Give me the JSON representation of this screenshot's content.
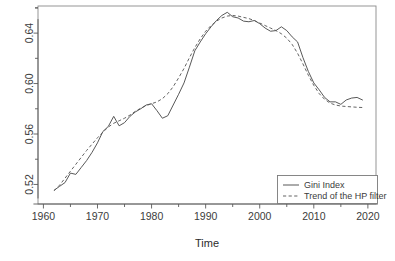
{
  "chart_data": {
    "type": "line",
    "title": "",
    "xlabel": "Time",
    "ylabel": "",
    "xlim": [
      1959.0,
      2021.5
    ],
    "ylim": [
      0.5045,
      0.6615
    ],
    "grid": false,
    "legend_position": "bottom-right",
    "x_ticks": [
      1960,
      1970,
      1980,
      1990,
      2000,
      2010,
      2020
    ],
    "x_tick_labels": [
      "1960",
      "1970",
      "1980",
      "1990",
      "2000",
      "2010",
      "2020"
    ],
    "x_minor_ticks": [
      1965,
      1975,
      1985,
      1995,
      2005,
      2015
    ],
    "y_ticks": [
      0.52,
      0.56,
      0.6,
      0.64
    ],
    "y_tick_labels": [
      "0.52",
      "0.56",
      "0.60",
      "0.64"
    ],
    "y_minor_ticks": [
      0.54,
      0.58,
      0.62,
      0.66
    ],
    "x": [
      1962,
      1963,
      1964,
      1965,
      1966,
      1967,
      1968,
      1969,
      1970,
      1971,
      1972,
      1973,
      1974,
      1975,
      1976,
      1977,
      1978,
      1979,
      1980,
      1981,
      1982,
      1983,
      1984,
      1985,
      1986,
      1987,
      1988,
      1989,
      1990,
      1991,
      1992,
      1993,
      1994,
      1995,
      1996,
      1997,
      1998,
      1999,
      2000,
      2001,
      2002,
      2003,
      2004,
      2005,
      2006,
      2007,
      2008,
      2009,
      2010,
      2011,
      2012,
      2013,
      2014,
      2015,
      2016,
      2017,
      2018,
      2019
    ],
    "series": [
      {
        "name": "Gini Index",
        "style": "solid",
        "values": [
          0.5155,
          0.5185,
          0.5215,
          0.529,
          0.528,
          0.5335,
          0.539,
          0.5455,
          0.553,
          0.562,
          0.566,
          0.574,
          0.5665,
          0.569,
          0.574,
          0.5775,
          0.58,
          0.583,
          0.584,
          0.5785,
          0.5725,
          0.5745,
          0.583,
          0.5915,
          0.6005,
          0.613,
          0.626,
          0.633,
          0.6395,
          0.645,
          0.65,
          0.654,
          0.6565,
          0.653,
          0.652,
          0.6495,
          0.649,
          0.65,
          0.6475,
          0.644,
          0.6415,
          0.642,
          0.645,
          0.642,
          0.637,
          0.633,
          0.6205,
          0.6095,
          0.6005,
          0.595,
          0.589,
          0.5855,
          0.5855,
          0.5835,
          0.587,
          0.5885,
          0.589,
          0.587
        ]
      },
      {
        "name": "Trend of the HP filter",
        "style": "dashed",
        "values": [
          0.515,
          0.5195,
          0.525,
          0.5305,
          0.536,
          0.5415,
          0.547,
          0.552,
          0.557,
          0.5615,
          0.5655,
          0.5685,
          0.5705,
          0.5725,
          0.575,
          0.578,
          0.5805,
          0.5825,
          0.584,
          0.5855,
          0.588,
          0.592,
          0.5975,
          0.6045,
          0.612,
          0.6205,
          0.6285,
          0.6355,
          0.6415,
          0.646,
          0.6495,
          0.652,
          0.6535,
          0.654,
          0.6535,
          0.6525,
          0.6515,
          0.65,
          0.648,
          0.646,
          0.644,
          0.642,
          0.6395,
          0.636,
          0.631,
          0.624,
          0.6155,
          0.6065,
          0.5985,
          0.592,
          0.5875,
          0.5845,
          0.583,
          0.5822,
          0.5818,
          0.5815,
          0.5812,
          0.581
        ]
      }
    ],
    "legend": {
      "entries": [
        {
          "label": "Gini Index",
          "style": "solid"
        },
        {
          "label": "Trend of the HP filter",
          "style": "dashed"
        }
      ]
    }
  },
  "figure": {
    "plot_left": 38,
    "plot_right": 376,
    "plot_top": 6,
    "plot_bottom": 204
  }
}
